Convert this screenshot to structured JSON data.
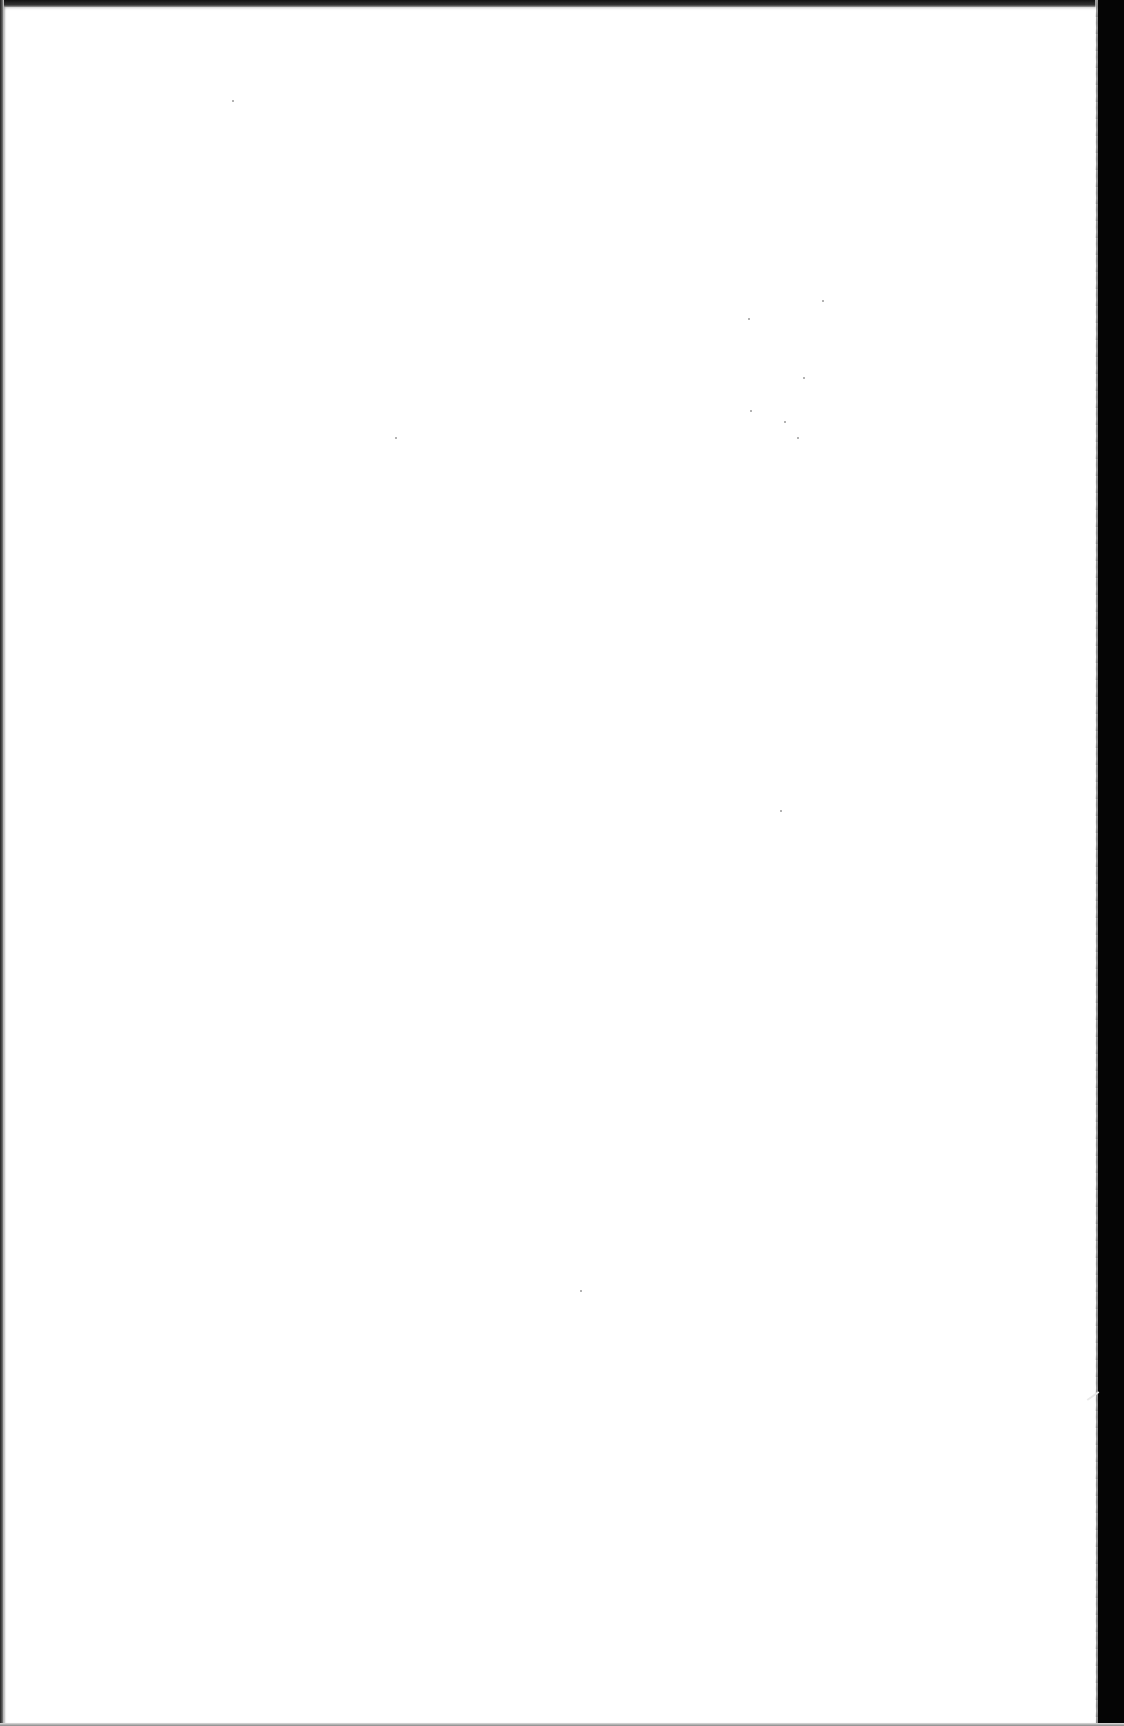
{
  "page": {
    "type": "blank-scanned-page",
    "text": "",
    "background_color": "#ffffff",
    "border_color": "#050505"
  },
  "artifacts": {
    "specks": [
      {
        "x": 822,
        "y": 300
      },
      {
        "x": 748,
        "y": 318
      },
      {
        "x": 803,
        "y": 377
      },
      {
        "x": 750,
        "y": 410
      },
      {
        "x": 784,
        "y": 421
      },
      {
        "x": 797,
        "y": 437
      },
      {
        "x": 395,
        "y": 437
      },
      {
        "x": 780,
        "y": 810
      },
      {
        "x": 580,
        "y": 1290
      },
      {
        "x": 232,
        "y": 100
      }
    ]
  }
}
